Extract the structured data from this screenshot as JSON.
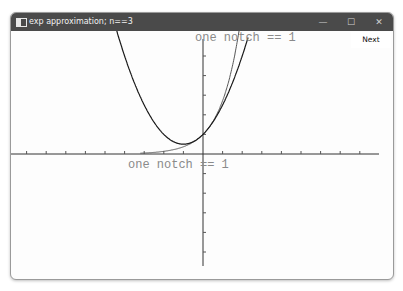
{
  "window": {
    "title": "exp approximation; n==3",
    "controls": {
      "minimize": "—",
      "maximize": "☐",
      "close": "✕"
    }
  },
  "toolbar": {
    "next_label": "Next"
  },
  "plot": {
    "x_axis_label": "one notch == 1",
    "y_axis_label": "one notch == 1",
    "colors": {
      "axes": "#333333",
      "exp_curve": "#555555",
      "approx_curve": "#1a1a1a",
      "label": "#8a8a8a"
    }
  },
  "chart_data": {
    "type": "line",
    "title": "exp approximation; n==3",
    "xlabel": "one notch == 1",
    "ylabel": "one notch == 1",
    "xlim": [
      -9.8,
      9.2
    ],
    "ylim": [
      -5.8,
      6.3
    ],
    "grid": false,
    "series": [
      {
        "name": "exp(x)",
        "function": "e^x",
        "x": [
          -4,
          -3,
          -2,
          -1,
          0,
          0.5,
          1,
          1.5,
          1.8
        ],
        "y": [
          0.018,
          0.05,
          0.135,
          0.368,
          1,
          1.649,
          2.718,
          4.482,
          6.05
        ]
      },
      {
        "name": "approximation",
        "function": "1 + x + x^2/2",
        "x": [
          -4.4,
          -4,
          -3,
          -2,
          -1,
          0,
          1,
          1.5,
          2
        ],
        "y": [
          6.28,
          5,
          2.5,
          1,
          0.5,
          1,
          2.5,
          3.625,
          5
        ]
      }
    ]
  }
}
